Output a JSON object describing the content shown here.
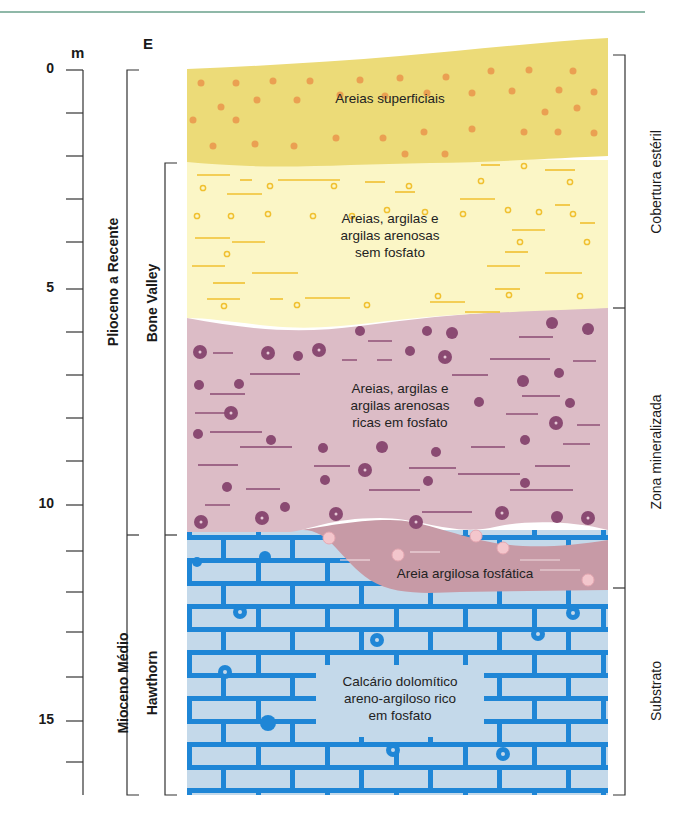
{
  "axis": {
    "unit": "m",
    "direction_label": "E",
    "ticks": [
      "0",
      "5",
      "10",
      "15"
    ],
    "tick_depths_m": [
      0,
      5,
      10,
      15
    ],
    "max_depth_m": 16.8
  },
  "age_brackets": [
    {
      "label": "Plioceno a Recente",
      "from_m": 0,
      "to_m": 10.8
    },
    {
      "label": "Mioceno Médio",
      "from_m": 10.8,
      "to_m": 16.8
    }
  ],
  "formation_brackets": [
    {
      "label": "Bone Valley",
      "from_m": 2.15,
      "to_m": 10.8
    },
    {
      "label": "Hawthorn",
      "from_m": 10.8,
      "to_m": 16.8
    }
  ],
  "zone_brackets": [
    {
      "label": "Cobertura estéril",
      "from_m": -0.35,
      "to_m": 5.5
    },
    {
      "label": "Zona mineralizada",
      "from_m": 5.5,
      "to_m": 12.0
    },
    {
      "label": "Substrato",
      "from_m": 12.0,
      "to_m": 16.8
    }
  ],
  "layers": [
    {
      "name": "Areias superficiais",
      "lines": [
        "Areias superficiais"
      ],
      "color": "#ecdb78",
      "pattern": "orange-dots"
    },
    {
      "name": "Areias, argilas e argilas arenosas sem fosfato",
      "lines": [
        "Areias, argilas e",
        "argilas arenosas",
        "sem fosfato"
      ],
      "color": "#fbf6c6",
      "pattern": "yellow-dashes-circles"
    },
    {
      "name": "Areias, argilas e argilas arenosas ricas em fosfato",
      "lines": [
        "Areias, argilas e",
        "argilas arenosas",
        "ricas em fosfato"
      ],
      "color": "#dcbcc6",
      "pattern": "purple-nodules-dashes"
    },
    {
      "name": "Areia argilosa fosfática",
      "lines": [
        "Areia argilosa fosfática"
      ],
      "color": "#c79aa6",
      "pattern": "pink-nodules"
    },
    {
      "name": "Calcário dolomítico areno-argiloso rico em fosfato",
      "lines": [
        "Calcário dolomítico",
        "areno-argiloso rico",
        "em fosfato"
      ],
      "color": "#c4d9ea",
      "pattern": "blue-bricks"
    }
  ],
  "colors": {
    "top_rule": "#8fb8a8",
    "axis": "#333333",
    "dot_orange": "#eaa052",
    "dash_yellow": "#f0c030",
    "nodule_purple": "#8a4a72",
    "brick_blue": "#1f86d6",
    "nodule_pink": "#f3c6cc"
  }
}
